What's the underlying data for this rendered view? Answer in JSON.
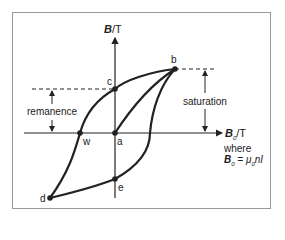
{
  "diagram": {
    "y_axis_label": {
      "symbol": "B",
      "unit": "/T"
    },
    "x_axis_label": {
      "symbol": "B",
      "sub": "0",
      "unit": "/T"
    },
    "where_text": "where",
    "formula": {
      "lhs": "B",
      "lhs_sub": "0",
      "eq": " = ",
      "rhs_mu": "μ",
      "rhs_sub": "0",
      "rhs_rest": "nI"
    },
    "points": {
      "a": "a",
      "b": "b",
      "c": "c",
      "d": "d",
      "e": "e",
      "w": "w"
    },
    "annotations": {
      "remanence": "remanence",
      "saturation": "saturation"
    }
  }
}
